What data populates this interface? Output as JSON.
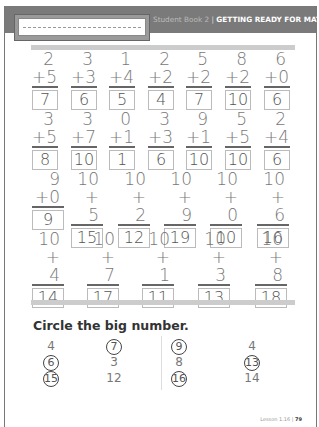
{
  "header": {
    "book": "Student Book 2",
    "separator": "|",
    "title": "GETTING READY FOR MATH"
  },
  "rows": [
    {
      "problems": [
        {
          "top": "2",
          "add": "+5",
          "ans": "7"
        },
        {
          "top": "3",
          "add": "+3",
          "ans": "6"
        },
        {
          "top": "1",
          "add": "+4",
          "ans": "5"
        },
        {
          "top": "2",
          "add": "+2",
          "ans": "4"
        },
        {
          "top": "5",
          "add": "+2",
          "ans": "7"
        },
        {
          "top": "8",
          "add": "+2",
          "ans": "10"
        },
        {
          "top": "6",
          "add": "+0",
          "ans": "6"
        }
      ]
    },
    {
      "problems": [
        {
          "top": "3",
          "add": "+5",
          "ans": "8"
        },
        {
          "top": "3",
          "add": "+7",
          "ans": "10"
        },
        {
          "top": "0",
          "add": "+1",
          "ans": "1"
        },
        {
          "top": "3",
          "add": "+3",
          "ans": "6"
        },
        {
          "top": "9",
          "add": "+1",
          "ans": "10"
        },
        {
          "top": "5",
          "add": "+5",
          "ans": "10"
        },
        {
          "top": "2",
          "add": "+4",
          "ans": "6"
        }
      ]
    },
    {
      "problems": [
        {
          "top": "9",
          "add": "+0",
          "ans": "9"
        },
        {
          "top": "10",
          "add": "+ 5",
          "ans": "15"
        },
        {
          "top": "10",
          "add": "+ 2",
          "ans": "12"
        },
        {
          "top": "10",
          "add": "+ 9",
          "ans": "19"
        },
        {
          "top": "10",
          "add": "+ 0",
          "ans": "10"
        },
        {
          "top": "10",
          "add": "+ 6",
          "ans": "16"
        }
      ]
    },
    {
      "problems": [
        {
          "top": "10",
          "add": "+ 4",
          "ans": "14"
        },
        {
          "top": "10",
          "add": "+ 7",
          "ans": "17"
        },
        {
          "top": "10",
          "add": "+ 1",
          "ans": "11"
        },
        {
          "top": "10",
          "add": "+ 3",
          "ans": "13"
        },
        {
          "top": "10",
          "add": "+ 8",
          "ans": "18"
        }
      ]
    }
  ],
  "circle": {
    "title": "Circle the big number.",
    "columns": [
      {
        "items": [
          {
            "n": "4",
            "c": false
          },
          {
            "n": "6",
            "c": true
          },
          {
            "n": "15",
            "c": true
          }
        ]
      },
      {
        "items": [
          {
            "n": "7",
            "c": true
          },
          {
            "n": "3",
            "c": false
          },
          {
            "n": "12",
            "c": false
          }
        ]
      },
      {
        "items": [
          {
            "n": "9",
            "c": true
          },
          {
            "n": "8",
            "c": false
          },
          {
            "n": "16",
            "c": true
          }
        ]
      },
      {
        "items": [
          {
            "n": "4",
            "c": false
          },
          {
            "n": "13",
            "c": true
          },
          {
            "n": "14",
            "c": false
          }
        ]
      }
    ]
  },
  "footer": {
    "lesson": "Lesson 1.16",
    "separator": "|",
    "page": "79"
  }
}
